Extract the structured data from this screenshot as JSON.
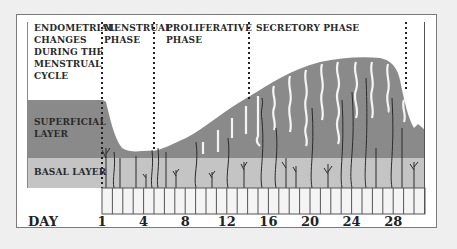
{
  "diagram": {
    "title": "ENDOMETRIAL CHANGES DURING THE MENSTRUAL CYCLE",
    "title_lines": [
      "ENDOMETRIAL",
      "CHANGES",
      "DURING THE",
      "MENSTRUAL",
      "CYCLE"
    ],
    "phases": [
      {
        "label_lines": [
          "MENSTRUAL",
          "PHASE"
        ],
        "start_day": 1,
        "end_day": 5
      },
      {
        "label_lines": [
          "PROLIFERATIVE",
          "PHASE"
        ],
        "start_day": 5,
        "end_day": 14
      },
      {
        "label_lines": [
          "SECRETORY PHASE"
        ],
        "start_day": 14,
        "end_day": 28
      }
    ],
    "layers": [
      {
        "label_lines": [
          "SUPERFICIAL",
          "LAYER"
        ],
        "color": "#8a8a8a"
      },
      {
        "label_lines": [
          "BASAL LAYER"
        ],
        "color": "#c4c4c4"
      }
    ],
    "axis": {
      "label": "DAY",
      "ticks": [
        "1",
        "4",
        "8",
        "12",
        "16",
        "20",
        "24",
        "28"
      ]
    }
  },
  "colors": {
    "background": "#efefef",
    "panel": "#ffffff",
    "superficial": "#8a8a8a",
    "basal": "#c4c4c4",
    "day_bar": "#f4f4f4",
    "text": "#2a2a2a"
  }
}
